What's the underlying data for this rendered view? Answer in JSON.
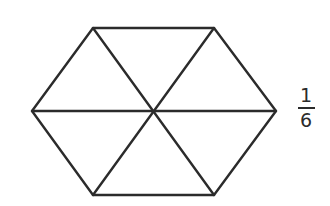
{
  "diagram": {
    "shape": "regular-hexagon",
    "stroke_color": "#2b2b2b",
    "stroke_width": 2.4,
    "center": [
      153,
      111
    ],
    "vertices": [
      [
        93,
        28
      ],
      [
        214,
        28
      ],
      [
        276,
        111
      ],
      [
        214,
        195
      ],
      [
        93,
        195
      ],
      [
        32,
        111
      ]
    ],
    "partitions": 6,
    "partition_shape": "equilateral-triangle"
  },
  "label": {
    "fraction": {
      "numerator": "1",
      "denominator": "6"
    }
  }
}
